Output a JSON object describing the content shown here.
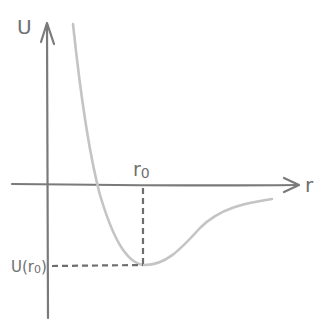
{
  "diagram": {
    "y_axis_label": "U",
    "x_axis_label": "r",
    "equilibrium_label_main": "r",
    "equilibrium_label_sub": "0",
    "min_energy_label_main": "U(r",
    "min_energy_label_sub": "0",
    "min_energy_label_close": ")",
    "colors": {
      "axes": "#7a7a7a",
      "curve": "#c4c4c4",
      "dashes": "#6e6e6e",
      "text": "#6f6f6f"
    }
  }
}
